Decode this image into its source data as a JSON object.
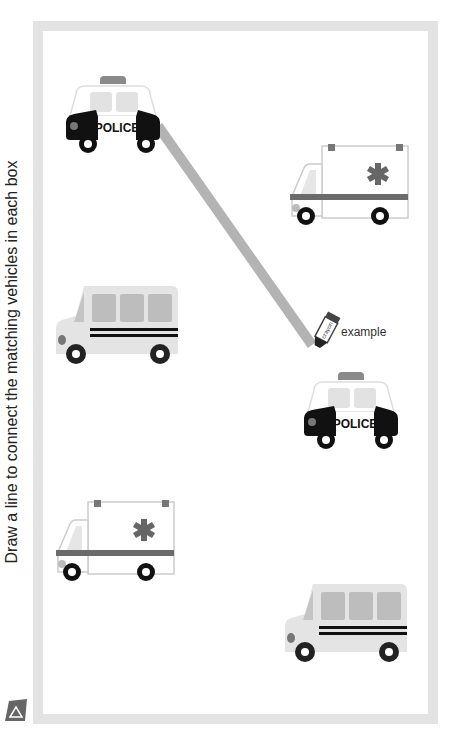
{
  "worksheet": {
    "instruction": "Draw a line to connect the matching vehicles in each box",
    "example_label": "example",
    "crayon_label": "crayon",
    "frame_color": "#e3e3e3",
    "line_color": "#b3b3b3",
    "left_column": [
      {
        "vehicle": "police car",
        "text": "POLICE"
      },
      {
        "vehicle": "bus"
      },
      {
        "vehicle": "ambulance"
      }
    ],
    "right_column": [
      {
        "vehicle": "ambulance"
      },
      {
        "vehicle": "police car",
        "text": "POLICE"
      },
      {
        "vehicle": "bus"
      }
    ],
    "example_connection": {
      "from": "left police car",
      "to": "right police car"
    }
  }
}
